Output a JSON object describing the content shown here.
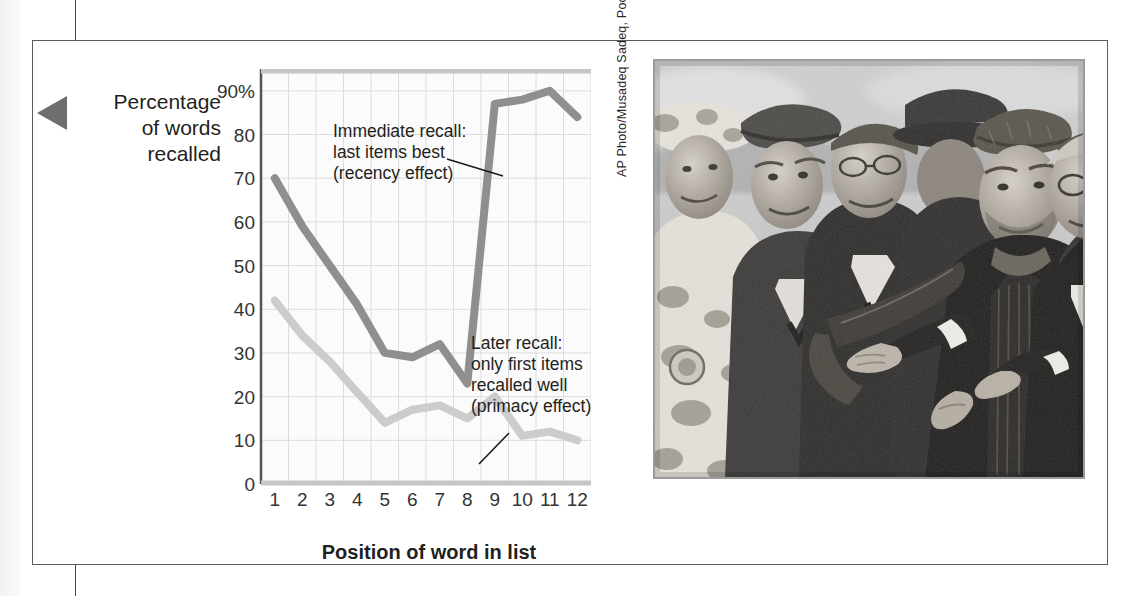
{
  "figure": {
    "edge_tab_icon": "left-pointer-tab"
  },
  "chart_data": {
    "type": "line",
    "title": "",
    "xlabel": "Position of word in list",
    "ylabel": "Percentage\nof words\nrecalled",
    "ylabel_lines": [
      "Percentage",
      "of words",
      "recalled"
    ],
    "categories": [
      1,
      2,
      3,
      4,
      5,
      6,
      7,
      8,
      9,
      10,
      11,
      12
    ],
    "xtick_labels": [
      "1",
      "2",
      "3",
      "4",
      "5",
      "6",
      "7",
      "8",
      "9",
      "10",
      "11",
      "12"
    ],
    "ytick_labels": [
      "90%",
      "80",
      "70",
      "60",
      "50",
      "40",
      "30",
      "20",
      "10",
      "0"
    ],
    "ytick_values": [
      90,
      80,
      70,
      60,
      50,
      40,
      30,
      20,
      10,
      0
    ],
    "ylim": [
      0,
      95
    ],
    "xlim": [
      0.5,
      12.5
    ],
    "grid": true,
    "legend": "none",
    "series": [
      {
        "name": "Immediate recall",
        "color": "#8f8f8f",
        "values": [
          70,
          59,
          50,
          41,
          30,
          29,
          32,
          23,
          87,
          88,
          90,
          84
        ]
      },
      {
        "name": "Later recall",
        "color": "#cccccc",
        "values": [
          42,
          34,
          28,
          21,
          14,
          17,
          18,
          15,
          20,
          11,
          12,
          10
        ]
      }
    ],
    "annotations": [
      {
        "name": "immediate-recall-annotation",
        "text": "Immediate recall:\nlast items best\n(recency effect)",
        "points_to_series": "Immediate recall",
        "points_to_x": 9
      },
      {
        "name": "later-recall-annotation",
        "text": "Later recall:\nonly first items\nrecalled well\n(primacy effect)",
        "points_to_series": "Later recall",
        "points_to_x": 9
      }
    ]
  },
  "photo": {
    "credit": "AP Photo/Musadeq Sadeq, Pool",
    "description": "Black-and-white news photograph of Hamid Karzai in a karakul cap shaking hands with a delegation of officials and a soldier in camouflage"
  }
}
